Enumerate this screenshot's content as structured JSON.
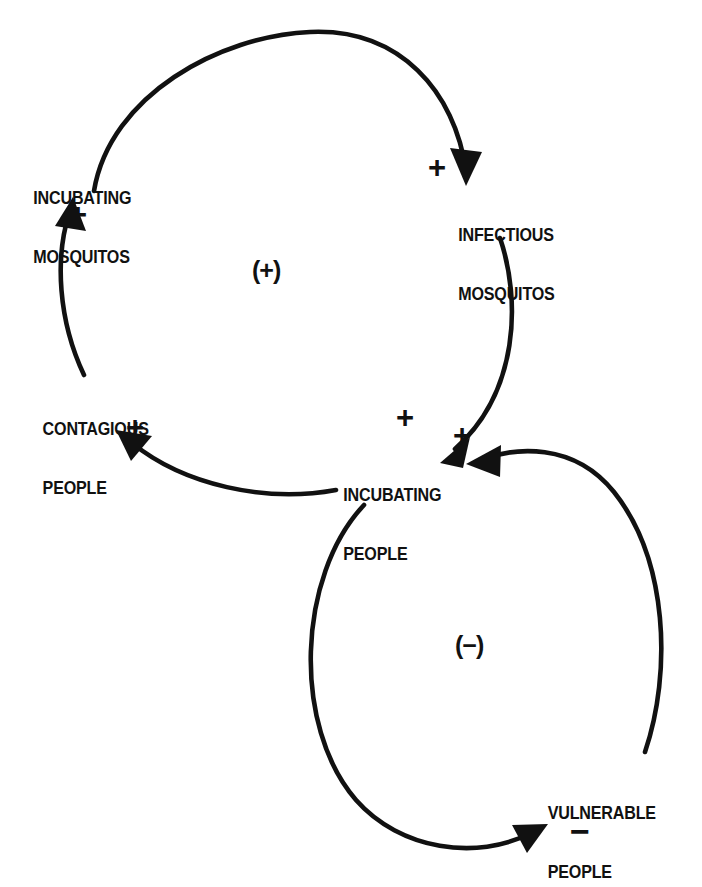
{
  "diagram": {
    "type": "causal-loop-diagram",
    "background_color": "#ffffff",
    "ink_color": "#111111",
    "variables": [
      {
        "id": "incubating-mosquitos",
        "line1": "INCUBATING",
        "line2": "MOSQUITOS",
        "x": 29,
        "y": 150
      },
      {
        "id": "infectious-mosquitos",
        "line1": "INFECTIOUS",
        "line2": "MOSQUITOS",
        "x": 454,
        "y": 187
      },
      {
        "id": "contagious-people",
        "line1": "CONTAGIOUS",
        "line2": "PEOPLE",
        "x": 38,
        "y": 381
      },
      {
        "id": "incubating-people",
        "line1": "INCUBATING",
        "line2": "PEOPLE",
        "x": 339,
        "y": 447
      },
      {
        "id": "vulnerable-people",
        "line1": "VULNERABLE",
        "line2": "PEOPLE",
        "x": 543,
        "y": 765
      }
    ],
    "link_polarities": [
      {
        "id": "incubating-mosquitos-to-infectious-mosquitos",
        "sign": "+",
        "from": "incubating-mosquitos",
        "to": "infectious-mosquitos",
        "x": 428,
        "y": 152
      },
      {
        "id": "infectious-mosquitos-to-incubating-people",
        "sign": "+",
        "from": "infectious-mosquitos",
        "to": "incubating-people",
        "x": 396,
        "y": 402
      },
      {
        "id": "incubating-people-to-contagious-people",
        "sign": "+",
        "from": "incubating-people",
        "to": "contagious-people",
        "x": 126,
        "y": 412
      },
      {
        "id": "contagious-people-to-incubating-mosquitos",
        "sign": "+",
        "from": "contagious-people",
        "to": "incubating-mosquitos",
        "x": 69,
        "y": 199
      },
      {
        "id": "vulnerable-people-to-incubating-people",
        "sign": "+",
        "from": "vulnerable-people",
        "to": "incubating-people",
        "x": 453,
        "y": 420
      },
      {
        "id": "incubating-people-to-vulnerable-people",
        "sign": "−",
        "from": "incubating-people",
        "to": "vulnerable-people",
        "x": 570,
        "y": 814
      }
    ],
    "loops": [
      {
        "id": "reinforcing-loop",
        "label": "(+)",
        "polarity": "reinforcing",
        "x": 252,
        "y": 258
      },
      {
        "id": "balancing-loop",
        "label": "(−)",
        "polarity": "balancing",
        "x": 455,
        "y": 633
      }
    ],
    "links": [
      {
        "id": "link-incubating-mosquitos-to-infectious-mosquitos",
        "path": "M 94 191 C 110 95 220 36 310 32 C 400 28 455 92 466 171",
        "arrow": "466,186 450,148 482,152"
      },
      {
        "id": "link-infectious-mosquitos-to-incubating-people",
        "path": "M 500 238 C 521 300 519 392 455 449",
        "arrow": "440,463 470,437 463,468"
      },
      {
        "id": "link-incubating-people-to-contagious-people",
        "path": "M 336 490 C 265 503 184 485 132 443",
        "arrow": "116,430 152,436 131,461"
      },
      {
        "id": "link-contagious-people-to-incubating-mosquitos",
        "path": "M 84 375 C 58 320 55 258 69 214",
        "arrow": "73,197 86,231 55,226"
      },
      {
        "id": "link-incubating-people-to-vulnerable-people",
        "path": "M 364 505 C 297 576 292 726 356 800 C 400 850 477 861 531 833",
        "arrow": "548,824 512,825 527,853"
      },
      {
        "id": "link-vulnerable-people-to-incubating-people",
        "path": "M 645 752 C 672 672 668 560 614 492 C 573 441 514 448 483 459",
        "arrow": "466,464 501,445 500,477"
      }
    ]
  }
}
